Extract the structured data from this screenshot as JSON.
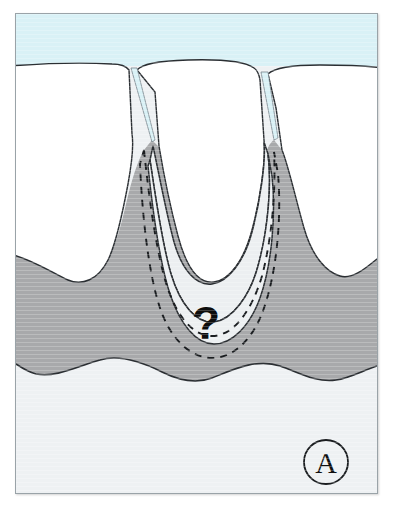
{
  "figure": {
    "panel_label": "A",
    "annotation_marker": "?",
    "colors": {
      "background": "#ffffff",
      "frame_border": "#9aa3a8",
      "sky_band": "#d9f1f6",
      "tooth_fill": "#ffffff",
      "gingiva_fill": "#a8a9ab",
      "bone_fill": "#eef1f3",
      "defect_fill": "#eceff1",
      "outline_stroke": "#2b2f33",
      "dashed_stroke": "#1a1d20",
      "label_text": "#111111",
      "marker_text": "#0d0d0d"
    },
    "layers": [
      {
        "name": "sky-band",
        "label": "Oral cavity space"
      },
      {
        "name": "tooth-left",
        "label": "Left tooth"
      },
      {
        "name": "tooth-center",
        "label": "Center tooth"
      },
      {
        "name": "tooth-right",
        "label": "Right tooth"
      },
      {
        "name": "gingiva-layer",
        "label": "Gingiva / alveolar bone"
      },
      {
        "name": "bone-layer",
        "label": "Underlying bone"
      },
      {
        "name": "defect-region",
        "label": "Infrabony defect"
      },
      {
        "name": "dashed-defect-outline",
        "label": "Defect boundary (dashed)"
      }
    ],
    "geometry": {
      "frame": {
        "x": 15,
        "y": 13,
        "width": 363,
        "height": 481
      },
      "sky_band_height": 52,
      "gingiva_top_y": 255,
      "gingiva_bottom_y": 378,
      "panel_circle": {
        "cx": 325,
        "cy": 462,
        "r": 22
      },
      "marker_position": {
        "x": 200,
        "y": 320
      }
    }
  }
}
